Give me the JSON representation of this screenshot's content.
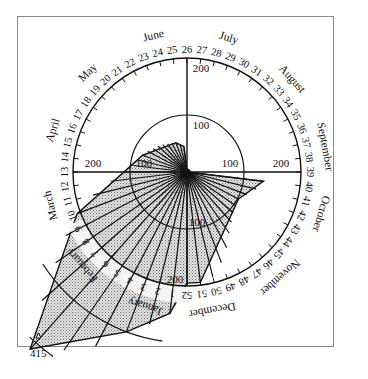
{
  "chart_data": {
    "type": "polar-area",
    "title": "",
    "radial_axis": {
      "ticks": [
        100,
        200
      ],
      "extended_arcs": [
        300,
        400
      ],
      "max_label": "415"
    },
    "months": [
      {
        "name": "January",
        "week": 2.5
      },
      {
        "name": "February",
        "week": 7
      },
      {
        "name": "March",
        "week": 11
      },
      {
        "name": "April",
        "week": 15.5
      },
      {
        "name": "May",
        "week": 19.5
      },
      {
        "name": "June",
        "week": 24
      },
      {
        "name": "July",
        "week": 28.5
      },
      {
        "name": "August",
        "week": 33
      },
      {
        "name": "September",
        "week": 37.5
      },
      {
        "name": "October",
        "week": 41.5
      },
      {
        "name": "November",
        "week": 46
      },
      {
        "name": "December",
        "week": 50.5
      }
    ],
    "weeks": [
      1,
      2,
      3,
      4,
      5,
      6,
      7,
      8,
      9,
      10,
      11,
      12,
      13,
      14,
      15,
      16,
      17,
      18,
      19,
      20,
      21,
      22,
      23,
      24,
      25,
      26,
      27,
      28,
      29,
      30,
      31,
      32,
      33,
      34,
      35,
      36,
      37,
      38,
      39,
      40,
      41,
      42,
      43,
      44,
      45,
      46,
      47,
      48,
      49,
      50,
      51,
      52
    ],
    "series": [
      {
        "name": "weekly count",
        "points": [
          {
            "week": 52,
            "value": 195
          },
          {
            "week": 1,
            "value": 250
          },
          {
            "week": 3,
            "value": 300
          },
          {
            "week": 6,
            "value": 415
          },
          {
            "week": 10,
            "value": 206
          },
          {
            "week": 16,
            "value": 83
          },
          {
            "week": 23,
            "value": 55
          },
          {
            "week": 25,
            "value": 45
          },
          {
            "week": 26,
            "value": 0
          },
          {
            "week": 39,
            "value": 0
          },
          {
            "week": 40,
            "value": 135
          },
          {
            "week": 43,
            "value": 102
          },
          {
            "week": 51,
            "value": 195
          }
        ]
      }
    ],
    "peak_label": "415"
  },
  "labels": {
    "ring_100_left": "100",
    "ring_100_right": "100",
    "ring_100_top": "100",
    "ring_100_bottom": "100",
    "ring_200_left": "200",
    "ring_200_right": "200",
    "ring_200_top": "200",
    "ring_200_bottom": "200",
    "peak": "415"
  }
}
